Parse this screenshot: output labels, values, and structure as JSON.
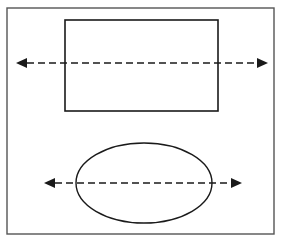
{
  "figure": {
    "background_color": "#ffffff",
    "stroke_color": "#1a1a1a",
    "frame_color": "#555555",
    "width": 283,
    "height": 243,
    "caption_fragment": ""
  },
  "frame": {
    "name": "outer-border",
    "x": 7,
    "y": 8,
    "width": 267,
    "height": 226,
    "stroke_width": 1.4
  },
  "shapes": [
    {
      "id": "rectangle",
      "label": "rectangle",
      "type": "rect",
      "x": 65,
      "y": 20,
      "width": 153,
      "height": 91,
      "stroke_width": 1.6
    },
    {
      "id": "ellipse",
      "label": "ellipse",
      "type": "ellipse",
      "cx": 144,
      "cy": 183,
      "rx": 68,
      "ry": 40,
      "stroke_width": 1.4
    }
  ],
  "axes": [
    {
      "id": "rectangle-axis",
      "label": "horizontal axis of symmetry through rectangle",
      "type": "double-headed-dashed-arrow",
      "x1": 16,
      "x2": 268,
      "y": 63,
      "dash": "7 4",
      "stroke_width": 1.7,
      "arrowhead_length": 11,
      "arrowhead_width": 10
    },
    {
      "id": "ellipse-axis",
      "label": "horizontal axis of symmetry through ellipse",
      "type": "double-headed-dashed-arrow",
      "x1": 44,
      "x2": 242,
      "y": 183,
      "dash": "7 4",
      "stroke_width": 1.7,
      "arrowhead_length": 11,
      "arrowhead_width": 10
    }
  ]
}
